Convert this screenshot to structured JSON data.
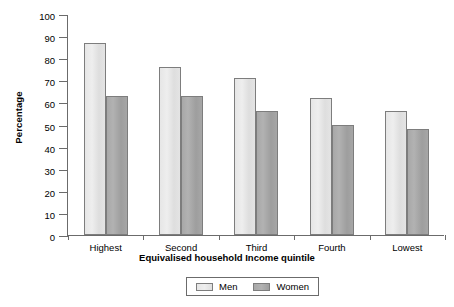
{
  "chart_data": {
    "type": "bar",
    "title": "",
    "xlabel": "Equivalised household Income quintile",
    "ylabel": "Percentage",
    "categories": [
      "Highest",
      "Second",
      "Third",
      "Fourth",
      "Lowest"
    ],
    "series": [
      {
        "name": "Men",
        "color": "#e4e4e4",
        "values": [
          87,
          76,
          71,
          62,
          56
        ]
      },
      {
        "name": "Women",
        "color": "#a6a6a6",
        "values": [
          63,
          63,
          56,
          50,
          48
        ]
      }
    ],
    "ylim": [
      0,
      100
    ],
    "ytick_step": 10,
    "yticks": [
      100,
      90,
      80,
      70,
      60,
      50,
      40,
      30,
      20,
      10,
      0
    ],
    "ytick_labels": [
      "100",
      "90",
      "80",
      "70",
      "60",
      "50",
      "40",
      "30",
      "20",
      "10",
      "0"
    ],
    "grid": false,
    "legend_position": "bottom-center",
    "legend_entries": [
      "Men",
      "Women"
    ]
  }
}
